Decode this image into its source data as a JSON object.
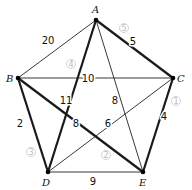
{
  "diagram": {
    "type": "weighted-graph",
    "vertices": [
      {
        "id": "A",
        "label": "A",
        "x": 96,
        "y": 20,
        "lx": 92,
        "ly": 13
      },
      {
        "id": "B",
        "label": "B",
        "x": 18,
        "y": 78,
        "lx": 6,
        "ly": 82
      },
      {
        "id": "C",
        "label": "C",
        "x": 173,
        "y": 78,
        "lx": 177,
        "ly": 82
      },
      {
        "id": "D",
        "label": "D",
        "x": 48,
        "y": 172,
        "lx": 42,
        "ly": 186
      },
      {
        "id": "E",
        "label": "E",
        "x": 143,
        "y": 172,
        "lx": 139,
        "ly": 186
      }
    ],
    "edges": [
      {
        "from": "A",
        "to": "B",
        "weight": "20",
        "bold": false,
        "lx": 48,
        "ly": 44
      },
      {
        "from": "A",
        "to": "C",
        "weight": "5",
        "bold": true,
        "lx": 133,
        "ly": 45,
        "order": "5",
        "ox": 124,
        "oy": 28
      },
      {
        "from": "A",
        "to": "D",
        "weight": "11",
        "bold": true,
        "lx": 66,
        "ly": 104,
        "order": "4",
        "ox": 71,
        "oy": 64
      },
      {
        "from": "A",
        "to": "E",
        "weight": "8",
        "bold": false,
        "lx": 115,
        "ly": 104
      },
      {
        "from": "B",
        "to": "C",
        "weight": "10",
        "bold": false,
        "lx": 88,
        "ly": 82
      },
      {
        "from": "B",
        "to": "D",
        "weight": "2",
        "bold": true,
        "lx": 20,
        "ly": 127,
        "order": "3",
        "ox": 31,
        "oy": 152
      },
      {
        "from": "B",
        "to": "E",
        "weight": "8",
        "bold": true,
        "lx": 76,
        "ly": 127,
        "order": "2",
        "ox": 106,
        "oy": 155
      },
      {
        "from": "C",
        "to": "D",
        "weight": "6",
        "bold": false,
        "lx": 108,
        "ly": 127
      },
      {
        "from": "C",
        "to": "E",
        "weight": "4",
        "bold": true,
        "lx": 164,
        "ly": 120,
        "order": "1",
        "ox": 176,
        "oy": 101
      },
      {
        "from": "D",
        "to": "E",
        "weight": "9",
        "bold": false,
        "lx": 93,
        "ly": 185
      }
    ],
    "circled_order": [
      "①",
      "②",
      "③",
      "④",
      "⑤"
    ],
    "colors": {
      "edge": "#222222",
      "bold_edge": "#1a1a1a",
      "vertex": "#000000",
      "order_mark": "#bdbdbd",
      "background": "#ffffff"
    }
  }
}
